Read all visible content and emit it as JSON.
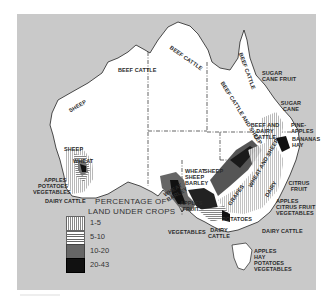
{
  "map": {
    "title": "Australia agricultural land use",
    "legend": {
      "title_line1": "PERCENTAGE OF",
      "title_line2": "LAND UNDER CROPS",
      "items": [
        {
          "label": "1-5",
          "pattern": "vertical-lines"
        },
        {
          "label": "5-10",
          "pattern": "horizontal-lines"
        },
        {
          "label": "10-20",
          "color": "#666666"
        },
        {
          "label": "20-43",
          "color": "#111111"
        }
      ]
    },
    "labels": {
      "beef_cattle_nt": "BEEF CATTLE",
      "beef_cattle_wa": "BEEF CATTLE",
      "beef_cattle_qld_north": "BEEF CATTLE",
      "beef_cattle_qld_mid": "BEEF CATTLE AND SHEEP",
      "sugar_cane_fruit": "SUGAR CANE FRUIT",
      "sugar_cane": "SUGAR CANE",
      "beef_dairy": "BEEF AND DAIRY CATTLE",
      "pineapples": "PINE-APPLES",
      "bananas_hay": "BANANAS HAY",
      "sheep_wa": "SHEEP",
      "sheep_sw": "SHEEP",
      "wheat_wa": "WHEAT",
      "apples_wa": "APPLES",
      "potatoes_wa": "POTATOES",
      "vegetables_wa": "VEGETABLES",
      "dairy_wa": "DAIRY CATTLE",
      "sheep_central": "SHEEP",
      "wheat_sheep_barley": "WHEAT SHEEP BARLEY",
      "wheat_barley": "WHEAT BARLEY",
      "apples_fruit": "APPLES FRUIT",
      "vegetables_sa": "VEGETABLES",
      "dairy_cattle_vic": "DAIRY CATTLE",
      "potatoes_vic": "POTATOES",
      "grapes": "GRAPES",
      "wheat_sheep_nsw": "WHEAT AND SHEEP",
      "dairy_nsw": "DAIRY",
      "citrus_fruit": "CITRUS FRUIT",
      "apples_citrus_veg": "APPLES CITRUS FRUIT VEGETABLES",
      "dairy_cattle_east": "DAIRY CATTLE",
      "tasmania": "APPLES HAY POTATOES VEGETABLES"
    }
  }
}
